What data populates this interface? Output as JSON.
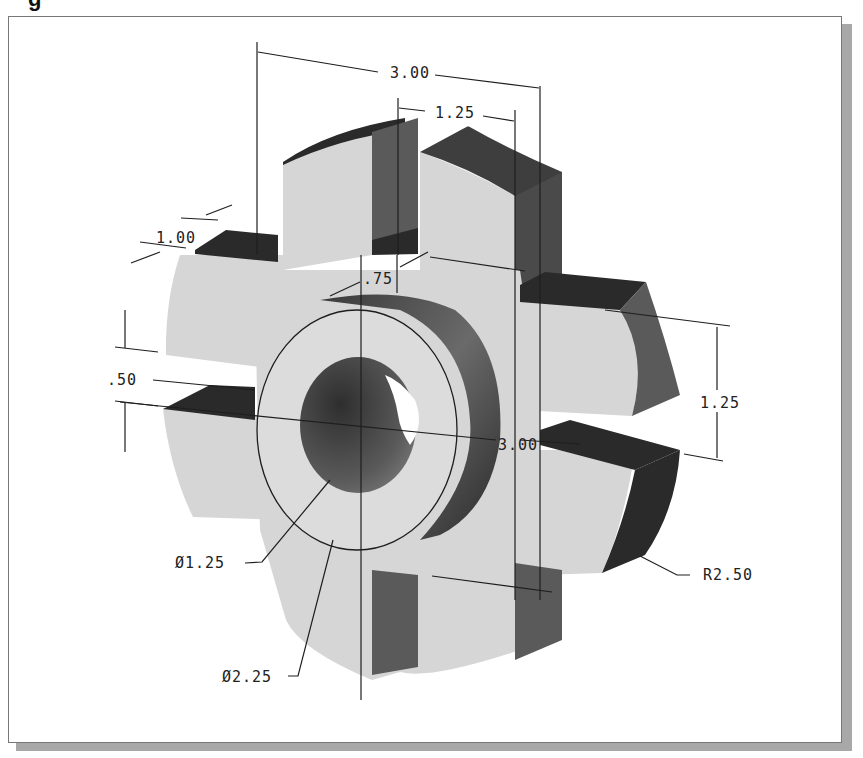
{
  "caption": {
    "fragment": "g"
  },
  "drawing": {
    "title": "Isometric view of flanged hub part with four slots",
    "dimensions": {
      "overall_width": "3.00",
      "slot_width_top": "1.25",
      "flange_thickness": "1.00",
      "hub_depth": ".75",
      "slot_gap": ".50",
      "slot_height_right": "1.25",
      "overall_height": "3.00",
      "bore_diameter": "Ø1.25",
      "hub_diameter": "Ø2.25",
      "outer_radius": "R2.50"
    },
    "colors": {
      "light_face": "#d4d4d4",
      "mid_face": "#6e6e6e",
      "dark_face": "#2a2a2a",
      "line": "#1e1e1e",
      "background": "#ffffff",
      "shadow": "#a8a8a8"
    }
  }
}
